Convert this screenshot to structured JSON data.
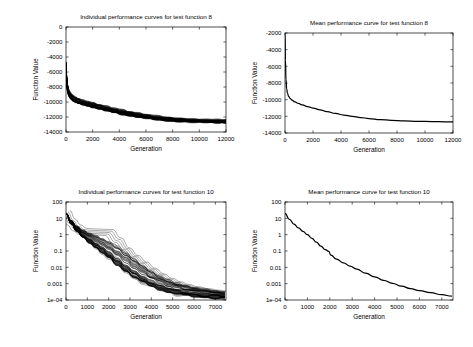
{
  "figure": {
    "background_color": "#ffffff",
    "line_color": "#000000",
    "panel_count": 4
  },
  "panels": {
    "top_left": {
      "title": "Individual performance curves for test function 8",
      "xlabel": "Generation",
      "ylabel": "Function Value"
    },
    "top_right": {
      "title": "Mean performance curve for test function 8",
      "xlabel": "Generation",
      "ylabel": "Function Value"
    },
    "bottom_left": {
      "title": "Individual performance curves for test function 10",
      "xlabel": "Generation",
      "ylabel": "Function Value"
    },
    "bottom_right": {
      "title": "Mean performance curve for test function 10",
      "xlabel": "Generation",
      "ylabel": "Function Value"
    }
  },
  "chart_data": [
    {
      "id": "top_left",
      "type": "line",
      "title": "Individual performance curves for test function 8",
      "xlabel": "Generation",
      "ylabel": "Function Value",
      "xscale": "linear",
      "yscale": "linear",
      "xlim": [
        0,
        12000
      ],
      "ylim": [
        -14000,
        0
      ],
      "xticks": [
        0,
        2000,
        4000,
        6000,
        8000,
        10000,
        12000
      ],
      "xticklabels": [
        "0",
        "2000",
        "4000",
        "6000",
        "8000",
        "10000",
        "12000"
      ],
      "yticks": [
        -14000,
        -12000,
        -10000,
        -8000,
        -6000,
        -4000,
        -2000,
        0
      ],
      "yticklabels": [
        "-14000",
        "-12000",
        "-10000",
        "-8000",
        "-6000",
        "-4000",
        "-2000",
        "0"
      ],
      "grid": false,
      "legend": "none",
      "series_count": 50,
      "series_kind": "individual-runs",
      "x": [
        0,
        60,
        130,
        220,
        340,
        500,
        700,
        950,
        1250,
        1600,
        2000,
        2500,
        3000,
        3600,
        4200,
        4800,
        5400,
        6000,
        6800,
        7600,
        8500,
        9500,
        10500,
        11400,
        12000
      ],
      "series": [
        {
          "name": "envelope-upper",
          "values": [
            -4600,
            -6600,
            -7700,
            -8350,
            -8750,
            -9050,
            -9300,
            -9520,
            -9720,
            -9900,
            -10080,
            -10320,
            -10540,
            -10800,
            -11040,
            -11260,
            -11460,
            -11640,
            -11860,
            -12030,
            -12180,
            -12290,
            -12350,
            -12380,
            -12390
          ]
        },
        {
          "name": "envelope-mean",
          "values": [
            -4900,
            -7150,
            -8250,
            -8850,
            -9200,
            -9460,
            -9680,
            -9880,
            -10060,
            -10230,
            -10400,
            -10640,
            -10870,
            -11130,
            -11370,
            -11580,
            -11770,
            -11940,
            -12140,
            -12290,
            -12420,
            -12510,
            -12560,
            -12590,
            -12600
          ]
        },
        {
          "name": "envelope-lower",
          "values": [
            -5300,
            -7700,
            -8800,
            -9350,
            -9650,
            -9880,
            -10070,
            -10250,
            -10420,
            -10580,
            -10740,
            -10970,
            -11190,
            -11440,
            -11670,
            -11870,
            -12040,
            -12190,
            -12360,
            -12490,
            -12590,
            -12660,
            -12700,
            -12720,
            -12730
          ]
        }
      ],
      "notes": "Approximately 50 overlapping monotone-decreasing runs forming a dense black band converging near -12600."
    },
    {
      "id": "top_right",
      "type": "line",
      "title": "Mean performance curve for test function 8",
      "xlabel": "Generation",
      "ylabel": "Function Value",
      "xscale": "linear",
      "yscale": "linear",
      "xlim": [
        0,
        12000
      ],
      "ylim": [
        -14000,
        -2000
      ],
      "xticks": [
        0,
        2000,
        4000,
        6000,
        8000,
        10000,
        12000
      ],
      "xticklabels": [
        "0",
        "2000",
        "4000",
        "6000",
        "8000",
        "10000",
        "12000"
      ],
      "yticks": [
        -14000,
        -12000,
        -10000,
        -8000,
        -6000,
        -4000,
        -2000
      ],
      "yticklabels": [
        "-14000",
        "-12000",
        "-10000",
        "-8000",
        "-6000",
        "-4000",
        "-2000"
      ],
      "grid": false,
      "legend": "none",
      "x": [
        0,
        30,
        70,
        120,
        180,
        260,
        360,
        500,
        700,
        950,
        1250,
        1600,
        2000,
        2500,
        3000,
        3600,
        4200,
        4800,
        5400,
        6000,
        6800,
        7600,
        8500,
        9500,
        10500,
        11400,
        12000
      ],
      "series": [
        {
          "name": "mean",
          "values": [
            -2050,
            -5200,
            -7600,
            -8700,
            -9250,
            -9600,
            -9850,
            -10060,
            -10260,
            -10450,
            -10630,
            -10820,
            -11000,
            -11220,
            -11430,
            -11650,
            -11840,
            -12000,
            -12140,
            -12260,
            -12390,
            -12480,
            -12550,
            -12600,
            -12630,
            -12650,
            -12660
          ]
        }
      ]
    },
    {
      "id": "bottom_left",
      "type": "line",
      "title": "Individual performance curves for test function 10",
      "xlabel": "Generation",
      "ylabel": "Function Value",
      "xscale": "linear",
      "yscale": "log",
      "xlim": [
        0,
        7500
      ],
      "ylim": [
        0.0001,
        100
      ],
      "xticks": [
        0,
        1000,
        2000,
        3000,
        4000,
        5000,
        6000,
        7000
      ],
      "xticklabels": [
        "0",
        "1000",
        "2000",
        "3000",
        "4000",
        "5000",
        "6000",
        "7000"
      ],
      "yticks": [
        0.0001,
        0.001,
        0.01,
        0.1,
        1,
        10,
        100
      ],
      "yticklabels": [
        "1e-04",
        "0.001",
        "0.01",
        "0.1",
        "1",
        "10",
        "100"
      ],
      "grid": false,
      "legend": "none",
      "series_count": 50,
      "series_kind": "individual-runs",
      "x": [
        0,
        250,
        500,
        800,
        1100,
        1400,
        1700,
        2000,
        2400,
        2800,
        3200,
        3600,
        4000,
        4400,
        4800,
        5200,
        5600,
        6000,
        6500,
        7000,
        7450
      ],
      "series": [
        {
          "name": "envelope-upper",
          "values": [
            20,
            7.5,
            3.5,
            1.9,
            1.25,
            0.9,
            0.62,
            0.4,
            0.2,
            0.085,
            0.033,
            0.014,
            0.0058,
            0.0029,
            0.0016,
            0.0011,
            0.00078,
            0.00058,
            0.00044,
            0.00035,
            0.0003
          ]
        },
        {
          "name": "envelope-mean",
          "values": [
            20,
            5.5,
            2.2,
            1.0,
            0.55,
            0.3,
            0.16,
            0.085,
            0.032,
            0.013,
            0.0055,
            0.0026,
            0.0014,
            0.00085,
            0.00055,
            0.0004,
            0.00032,
            0.00027,
            0.00023,
            0.0002,
            0.00019
          ]
        },
        {
          "name": "envelope-lower",
          "values": [
            20,
            4.2,
            1.5,
            0.6,
            0.28,
            0.13,
            0.062,
            0.029,
            0.011,
            0.0044,
            0.0019,
            0.00095,
            0.00055,
            0.00036,
            0.00026,
            0.0002,
            0.00017,
            0.00015,
            0.00013,
            0.00012,
            0.00011
          ]
        },
        {
          "name": "outlier-plateau-run",
          "values": [
            20,
            6.0,
            2.6,
            1.6,
            1.5,
            1.45,
            1.4,
            1.35,
            0.42,
            0.13,
            0.045,
            0.018,
            0.0075,
            0.0034,
            0.0018,
            0.0011,
            0.00075,
            0.00055,
            0.00042,
            0.00034,
            0.0003
          ]
        }
      ],
      "notes": "Dense bundle of ~50 log-decaying runs; a few outliers hold a plateau near 1.5 until ~generation 2000 then drop."
    },
    {
      "id": "bottom_right",
      "type": "line",
      "title": "Mean performance curve for test function 10",
      "xlabel": "Generation",
      "ylabel": "Function Value",
      "xscale": "linear",
      "yscale": "log",
      "xlim": [
        0,
        7500
      ],
      "ylim": [
        0.0001,
        100
      ],
      "xticks": [
        0,
        1000,
        2000,
        3000,
        4000,
        5000,
        6000,
        7000
      ],
      "xticklabels": [
        "0",
        "1000",
        "2000",
        "3000",
        "4000",
        "5000",
        "6000",
        "7000"
      ],
      "yticks": [
        0.0001,
        0.001,
        0.01,
        0.1,
        1,
        10,
        100
      ],
      "yticklabels": [
        "1e-04",
        "0.001",
        "0.01",
        "0.1",
        "1",
        "10",
        "100"
      ],
      "grid": false,
      "legend": "none",
      "x": [
        0,
        200,
        400,
        600,
        800,
        1000,
        1200,
        1400,
        1600,
        1800,
        1950,
        2050,
        2300,
        2600,
        2900,
        3200,
        3600,
        4000,
        4400,
        4800,
        5200,
        5600,
        6000,
        6500,
        7000,
        7450
      ],
      "series": [
        {
          "name": "mean",
          "values": [
            20,
            8.5,
            4.5,
            2.6,
            1.6,
            1.0,
            0.6,
            0.35,
            0.2,
            0.12,
            0.095,
            0.055,
            0.032,
            0.019,
            0.012,
            0.0078,
            0.0044,
            0.0026,
            0.0016,
            0.00105,
            0.0007,
            0.0005,
            0.00038,
            0.00028,
            0.00021,
            0.00017
          ]
        }
      ],
      "notes": "Single mean curve with a visible kink near generation 2000."
    }
  ]
}
